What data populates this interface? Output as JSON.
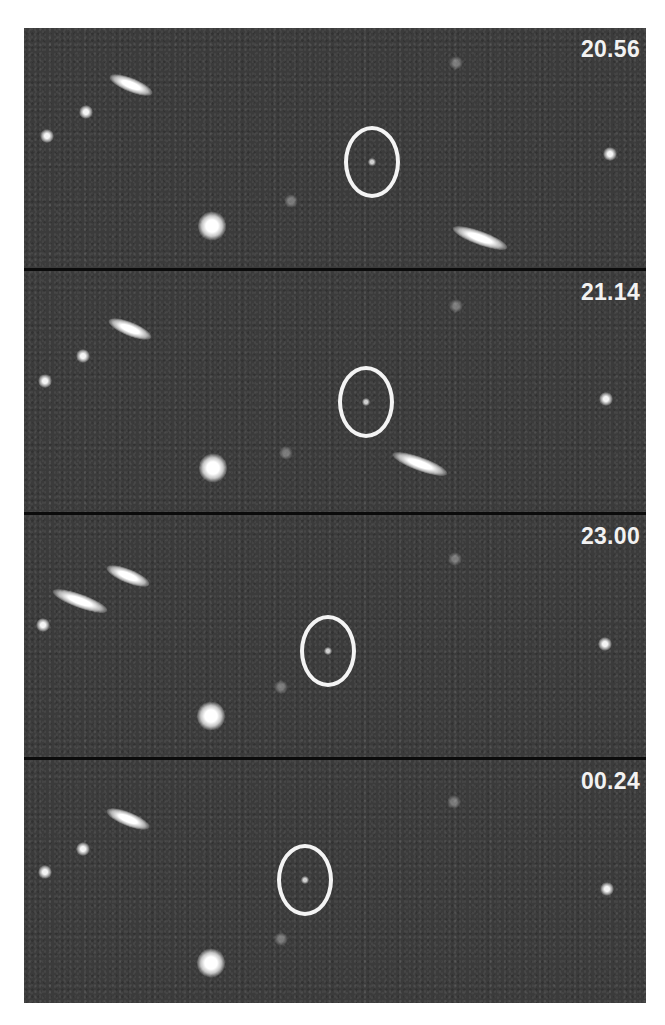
{
  "figure": {
    "colors": {
      "background": "#3b3b3b",
      "divider": "#0b0b0b",
      "label": "#f2f2f2",
      "circle": "#f4f4f4"
    },
    "panels": [
      {
        "label": "20.56"
      },
      {
        "label": "21.14"
      },
      {
        "label": "23.00"
      },
      {
        "label": "00.24"
      }
    ]
  }
}
